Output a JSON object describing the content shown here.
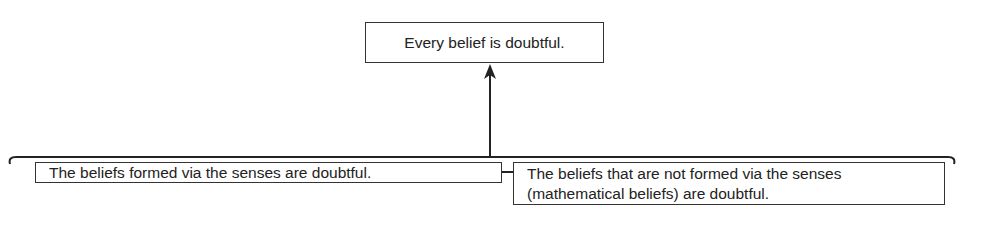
{
  "diagram": {
    "conclusion": "Every belief is doubtful.",
    "premises": [
      "The beliefs formed via the senses are doubtful.",
      "The beliefs that are not formed via the senses (mathematical beliefs) are doubtful."
    ],
    "relation": "premises jointly support conclusion",
    "line_color": "#222222"
  }
}
